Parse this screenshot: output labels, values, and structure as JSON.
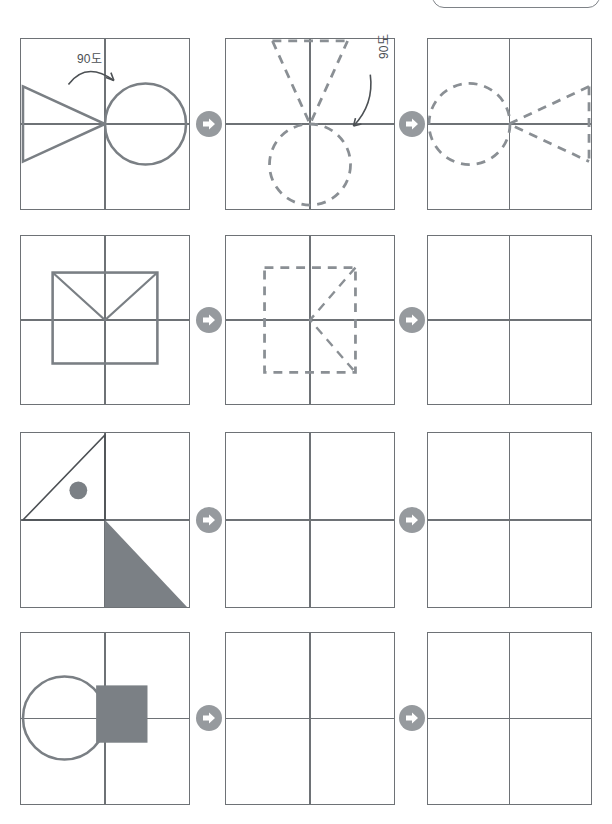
{
  "document": {
    "title": "도형 회전 학습지",
    "top_bar": {
      "visible": true,
      "label": ""
    }
  },
  "legend": {
    "stroke_solid_color": "#7a7f84",
    "stroke_dashed_color": "#8a8f94",
    "fill_color": "#7b8085",
    "grid_color": "#6e7276",
    "arrow_circle_color": "#969a9e",
    "arrow_glyph_color": "#ffffff"
  },
  "icons": {
    "step_arrow": "arrow-right-circle-icon",
    "rotation_arrow": "curved-arrow-icon"
  },
  "rows": [
    {
      "id": "row-1",
      "annotations": [
        {
          "name": "angle-label-1",
          "text": "90도",
          "panel": 1,
          "orientation": "horizontal"
        },
        {
          "name": "angle-label-2",
          "text": "90도",
          "panel": 2,
          "orientation": "rotated"
        }
      ],
      "panels": [
        {
          "id": "r1p1",
          "state": "given",
          "style": "solid",
          "shapes": [
            "triangle-pointing-right",
            "circle-right-of-center"
          ]
        },
        {
          "id": "r1p2",
          "state": "answer",
          "style": "dashed",
          "shapes": [
            "triangle-pointing-up",
            "circle-below-center"
          ]
        },
        {
          "id": "r1p3",
          "state": "answer",
          "style": "dashed",
          "shapes": [
            "circle-left-of-center",
            "triangle-pointing-left"
          ]
        }
      ]
    },
    {
      "id": "row-2",
      "annotations": [],
      "panels": [
        {
          "id": "r2p1",
          "state": "given",
          "style": "solid",
          "shapes": [
            "rectangle-with-v-diagonals-top"
          ]
        },
        {
          "id": "r2p2",
          "state": "answer",
          "style": "dashed",
          "shapes": [
            "rectangle-with-v-diagonals-right"
          ]
        },
        {
          "id": "r2p3",
          "state": "empty",
          "style": "none",
          "shapes": []
        }
      ]
    },
    {
      "id": "row-3",
      "annotations": [],
      "panels": [
        {
          "id": "r3p1",
          "state": "given",
          "style": "solid",
          "shapes": [
            "outlined-triangle-upper-left",
            "filled-dot-upper-left",
            "filled-triangle-lower-right"
          ]
        },
        {
          "id": "r3p2",
          "state": "empty",
          "style": "none",
          "shapes": []
        },
        {
          "id": "r3p3",
          "state": "empty",
          "style": "none",
          "shapes": []
        }
      ]
    },
    {
      "id": "row-4",
      "annotations": [],
      "panels": [
        {
          "id": "r4p1",
          "state": "given",
          "style": "solid",
          "shapes": [
            "outlined-circle-left",
            "filled-square-center-right"
          ]
        },
        {
          "id": "r4p2",
          "state": "empty",
          "style": "none",
          "shapes": []
        },
        {
          "id": "r4p3",
          "state": "empty",
          "style": "none",
          "shapes": []
        }
      ]
    }
  ]
}
